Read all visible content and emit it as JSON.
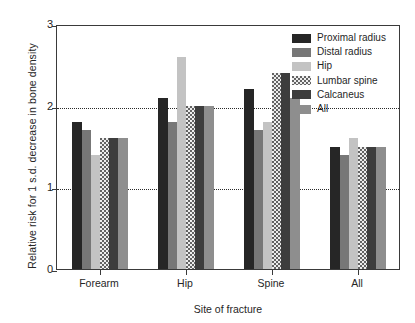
{
  "chart_data": {
    "type": "bar",
    "title": "",
    "xlabel": "Site of fracture",
    "ylabel": "Relative risk for 1 s.d. decrease in bone density",
    "categories": [
      "Forearm",
      "Hip",
      "Spine",
      "All"
    ],
    "ylim": [
      0,
      3
    ],
    "yticks": [
      "0",
      "1",
      "2",
      "3"
    ],
    "ytick_values": [
      0,
      1,
      2,
      3
    ],
    "gridlines": [
      1,
      2
    ],
    "grid": true,
    "grid_style": "dotted",
    "legend_position": "top-right",
    "series": [
      {
        "name": "Proximal radius",
        "color": "#262626",
        "pattern": "solid",
        "values": [
          1.8,
          2.1,
          2.2,
          1.5
        ]
      },
      {
        "name": "Distal radius",
        "color": "#777777",
        "pattern": "solid",
        "values": [
          1.7,
          1.8,
          1.7,
          1.4
        ]
      },
      {
        "name": "Hip",
        "color": "#c3c3c3",
        "pattern": "solid",
        "values": [
          1.4,
          2.6,
          1.8,
          1.6
        ]
      },
      {
        "name": "Lumbar spine",
        "color": "#ededed",
        "pattern": "dotted",
        "values": [
          1.6,
          2.0,
          2.4,
          1.5
        ]
      },
      {
        "name": "Calcaneus",
        "color": "#3d3d3d",
        "pattern": "solid",
        "values": [
          1.6,
          2.0,
          2.4,
          1.5
        ]
      },
      {
        "name": "All",
        "color": "#8e8e8e",
        "pattern": "solid",
        "values": [
          1.6,
          2.0,
          2.1,
          1.5
        ]
      }
    ]
  }
}
